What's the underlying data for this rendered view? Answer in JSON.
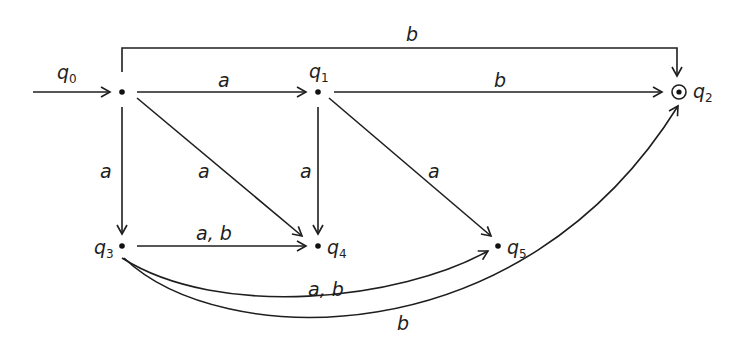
{
  "diagram": {
    "type": "finite-automaton",
    "colors": {
      "stroke": "#1e1e1e",
      "background": "#ffffff"
    },
    "states": [
      {
        "id": "q0",
        "name": "q",
        "sub": "0",
        "initial": true,
        "final": false
      },
      {
        "id": "q1",
        "name": "q",
        "sub": "1",
        "initial": false,
        "final": false
      },
      {
        "id": "q2",
        "name": "q",
        "sub": "2",
        "initial": false,
        "final": true
      },
      {
        "id": "q3",
        "name": "q",
        "sub": "3",
        "initial": false,
        "final": false
      },
      {
        "id": "q4",
        "name": "q",
        "sub": "4",
        "initial": false,
        "final": false
      },
      {
        "id": "q5",
        "name": "q",
        "sub": "5",
        "initial": false,
        "final": false
      }
    ],
    "transitions": [
      {
        "from": "q0",
        "to": "q1",
        "label": "a"
      },
      {
        "from": "q0",
        "to": "q2",
        "label": "b"
      },
      {
        "from": "q0",
        "to": "q3",
        "label": "a"
      },
      {
        "from": "q0",
        "to": "q4",
        "label": "a"
      },
      {
        "from": "q1",
        "to": "q2",
        "label": "b"
      },
      {
        "from": "q1",
        "to": "q4",
        "label": "a"
      },
      {
        "from": "q1",
        "to": "q5",
        "label": "a"
      },
      {
        "from": "q3",
        "to": "q4",
        "label": "a, b"
      },
      {
        "from": "q3",
        "to": "q5",
        "label": "a, b"
      },
      {
        "from": "q3",
        "to": "q2",
        "label": "b"
      }
    ]
  }
}
